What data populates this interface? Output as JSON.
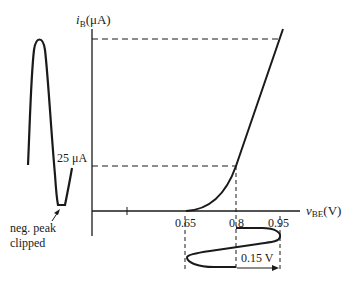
{
  "figure": {
    "type": "transistor input characteristic with waveform projection",
    "y_axis_label": {
      "symbol": "i",
      "subscript": "B",
      "unit": "(μA)"
    },
    "x_axis_label": {
      "symbol": "v",
      "subscript": "BE",
      "unit": "(V)"
    },
    "x_ticks": [
      "0.65",
      "0.8",
      "0.95"
    ],
    "current_marker": "25 μA",
    "swing_label": "0.15 V",
    "annotation": {
      "line1": "neg. peak",
      "line2": "clipped"
    },
    "colors": {
      "ink": "#1a1a1a",
      "background": "#ffffff"
    }
  }
}
